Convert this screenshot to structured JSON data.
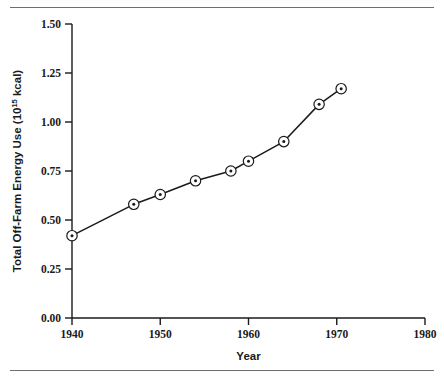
{
  "figure": {
    "top_rule": "",
    "bottom_rule": ""
  },
  "chart_data": {
    "type": "line",
    "title": "",
    "xlabel": "Year",
    "ylabel": "Total Off-Farm Energy Use (10",
    "ylabel_superscript": "15",
    "ylabel_suffix": " kcal)",
    "xlim": [
      1940,
      1980
    ],
    "ylim": [
      0.0,
      1.5
    ],
    "xticks": [
      1940,
      1950,
      1960,
      1970,
      1980
    ],
    "xtick_labels": [
      "1940",
      "1950",
      "1960",
      "1970",
      "1980"
    ],
    "yticks": [
      0.0,
      0.25,
      0.5,
      0.75,
      1.0,
      1.25,
      1.5
    ],
    "ytick_labels": [
      "0.00",
      "0.25",
      "0.50",
      "0.75",
      "1.00",
      "1.25",
      "1.50"
    ],
    "grid": false,
    "legend": null,
    "marker": "circle-with-dot",
    "line_color": "#1a1a1a",
    "marker_color": "#1a1a1a",
    "x": [
      1940,
      1947,
      1950,
      1954,
      1958,
      1960,
      1964,
      1968,
      1970.5
    ],
    "values": [
      0.42,
      0.58,
      0.63,
      0.7,
      0.75,
      0.8,
      0.9,
      1.09,
      1.17
    ],
    "series": [
      {
        "name": "Total Off-Farm Energy Use",
        "x": [
          1940,
          1947,
          1950,
          1954,
          1958,
          1960,
          1964,
          1968,
          1970.5
        ],
        "values": [
          0.42,
          0.58,
          0.63,
          0.7,
          0.75,
          0.8,
          0.9,
          1.09,
          1.17
        ]
      }
    ]
  }
}
